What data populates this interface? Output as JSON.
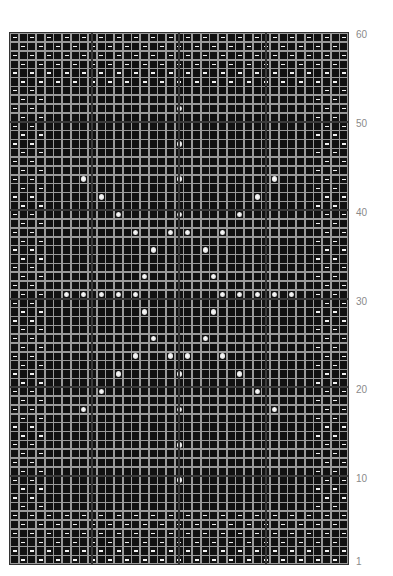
{
  "chart_data": {
    "type": "knitting-chart",
    "columns": 39,
    "rows": 60,
    "row_labels": [
      {
        "label": "60",
        "row": 60
      },
      {
        "label": "50",
        "row": 50
      },
      {
        "label": "40",
        "row": 40
      },
      {
        "label": "30",
        "row": 30
      },
      {
        "label": "20",
        "row": 20
      },
      {
        "label": "10",
        "row": 10
      },
      {
        "label": "1",
        "row": 1
      }
    ],
    "border": {
      "top_rows": 6,
      "bottom_rows": 6,
      "side_cols": 4,
      "pattern": "seed-stitch-checker"
    },
    "symbols": {
      "dash": "purl",
      "dot": "bobble",
      "empty": "knit"
    },
    "bobbles_from_top": [
      [
        8,
        19
      ],
      [
        12,
        19
      ],
      [
        16,
        8
      ],
      [
        16,
        19
      ],
      [
        16,
        30
      ],
      [
        18,
        10
      ],
      [
        18,
        28
      ],
      [
        20,
        12
      ],
      [
        20,
        19
      ],
      [
        20,
        26
      ],
      [
        22,
        14
      ],
      [
        22,
        18
      ],
      [
        22,
        20
      ],
      [
        22,
        24
      ],
      [
        24,
        16
      ],
      [
        24,
        22
      ],
      [
        27,
        15
      ],
      [
        27,
        23
      ],
      [
        29,
        6
      ],
      [
        29,
        8
      ],
      [
        29,
        10
      ],
      [
        29,
        12
      ],
      [
        29,
        14
      ],
      [
        29,
        24
      ],
      [
        29,
        26
      ],
      [
        29,
        28
      ],
      [
        29,
        30
      ],
      [
        29,
        32
      ],
      [
        31,
        15
      ],
      [
        31,
        23
      ],
      [
        34,
        16
      ],
      [
        34,
        22
      ],
      [
        36,
        14
      ],
      [
        36,
        18
      ],
      [
        36,
        20
      ],
      [
        36,
        24
      ],
      [
        38,
        12
      ],
      [
        38,
        19
      ],
      [
        38,
        26
      ],
      [
        40,
        10
      ],
      [
        40,
        28
      ],
      [
        42,
        8
      ],
      [
        42,
        19
      ],
      [
        42,
        30
      ],
      [
        46,
        19
      ],
      [
        50,
        19
      ]
    ],
    "colors": {
      "background": "#111111",
      "grid": "#9a9a9a",
      "symbol": "#f2f2f2",
      "label": "#8a8a8a"
    }
  }
}
